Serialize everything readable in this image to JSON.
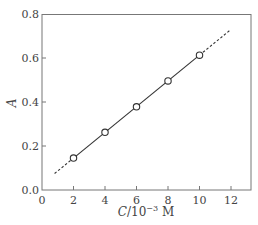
{
  "chart_data": {
    "type": "line",
    "title": "",
    "xlabel": "C/10^-3 M",
    "xlabel_parts": {
      "var": "C",
      "base": "/10",
      "exp": "−3",
      "unit": " M"
    },
    "ylabel": "A",
    "xlim": [
      0,
      13
    ],
    "ylim": [
      0,
      0.8
    ],
    "xticks": [
      0,
      2,
      4,
      6,
      8,
      10,
      12
    ],
    "yticks": [
      0.0,
      0.2,
      0.4,
      0.6,
      0.8
    ],
    "xtick_labels": [
      "0",
      "2",
      "4",
      "6",
      "8",
      "10",
      "12"
    ],
    "ytick_labels": [
      "0.0",
      "0.2",
      "0.4",
      "0.6",
      "0.8"
    ],
    "grid": false,
    "legend": null,
    "series": [
      {
        "name": "measured",
        "style": "open-circle markers",
        "x": [
          2,
          4,
          6,
          8,
          10
        ],
        "y": [
          0.145,
          0.262,
          0.378,
          0.496,
          0.613
        ]
      },
      {
        "name": "linear fit (solid within data)",
        "style": "solid",
        "x": [
          2,
          10
        ],
        "y": [
          0.145,
          0.613
        ]
      },
      {
        "name": "extrapolation (dashed)",
        "style": "dashed",
        "segments": [
          {
            "x": [
              0.8,
              2
            ],
            "y": [
              0.075,
              0.145
            ]
          },
          {
            "x": [
              10,
              11.9
            ],
            "y": [
              0.613,
              0.724
            ]
          }
        ]
      }
    ]
  }
}
